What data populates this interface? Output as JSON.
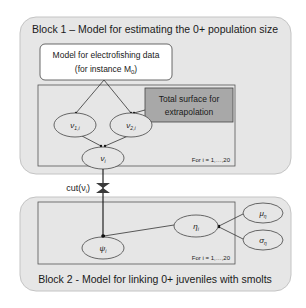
{
  "block1": {
    "title": "Block 1 – Model for estimating the 0+ population size",
    "model_box": {
      "line1": "Model for electrofishing data",
      "line2": "(for instance M",
      "line2_sub": "0",
      "line2_end": ")"
    },
    "surface_box": {
      "line1": "Total surface for",
      "line2": "extrapolation"
    },
    "nodes": {
      "nu1": {
        "base": "ν",
        "sub": "1,i"
      },
      "nu2": {
        "base": "ν",
        "sub": "2,i"
      },
      "nu": {
        "base": "ν",
        "sub": "i"
      }
    },
    "plate_label": "For i = 1,…,20"
  },
  "cut": {
    "label": "cut(ν",
    "sub": "i",
    "end": ")"
  },
  "block2": {
    "title": "Block 2  -  Model for linking 0+ juveniles with smolts",
    "nodes": {
      "psi": {
        "base": "ψ",
        "sub": "i"
      },
      "eta": {
        "base": "η",
        "sub": "i"
      },
      "mu": {
        "base": "μ",
        "sub": "η"
      },
      "sigma": {
        "base": "σ",
        "sub": "η"
      }
    },
    "plate_label": "For i = 1,…,20"
  },
  "colors": {
    "block_bg": "#e6e6e6",
    "block_border": "#b8b8b8",
    "surface_bg": "#a6a6a6",
    "line": "#3a3a3a"
  }
}
